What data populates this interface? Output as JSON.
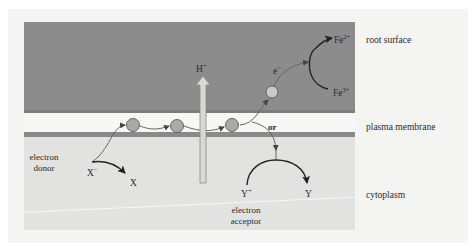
{
  "diagram": {
    "regions": {
      "root_surface": "root surface",
      "plasma_membrane": "plasma membrane",
      "cytoplasm": "cytoplasm"
    },
    "labels": {
      "electron_donor_line1": "electron",
      "electron_donor_line2": "donor",
      "x_minus": "X",
      "x_minus_sup": "−",
      "x": "X",
      "h_plus": "H",
      "h_plus_sup": "+",
      "e_minus": "e",
      "e_minus_sup": "−",
      "fe2": "Fe",
      "fe2_sup": "2+",
      "fe3": "Fe",
      "fe3_sup": "3+",
      "or": "or",
      "y_plus": "Y",
      "y_plus_sup": "+",
      "y": "Y",
      "electron_acceptor_line1": "electron",
      "electron_acceptor_line2": "acceptor"
    },
    "colors": {
      "page_bg": "#ffffff",
      "panel_bg": "#f4f4f2",
      "root_surface": "#8c8c8c",
      "membrane_band": "#f7f7f5",
      "membrane_line": "#8a8a8a",
      "cytoplasm": "#e2e2e0",
      "carrier_fill": "#a9a9a7",
      "carrier_stroke": "#5a5a5a",
      "outer_carrier_fill": "#c9c9c7",
      "arrow_fill": "#d8d8d6",
      "path_stroke": "#555555",
      "text": "#2a2a2a"
    }
  }
}
